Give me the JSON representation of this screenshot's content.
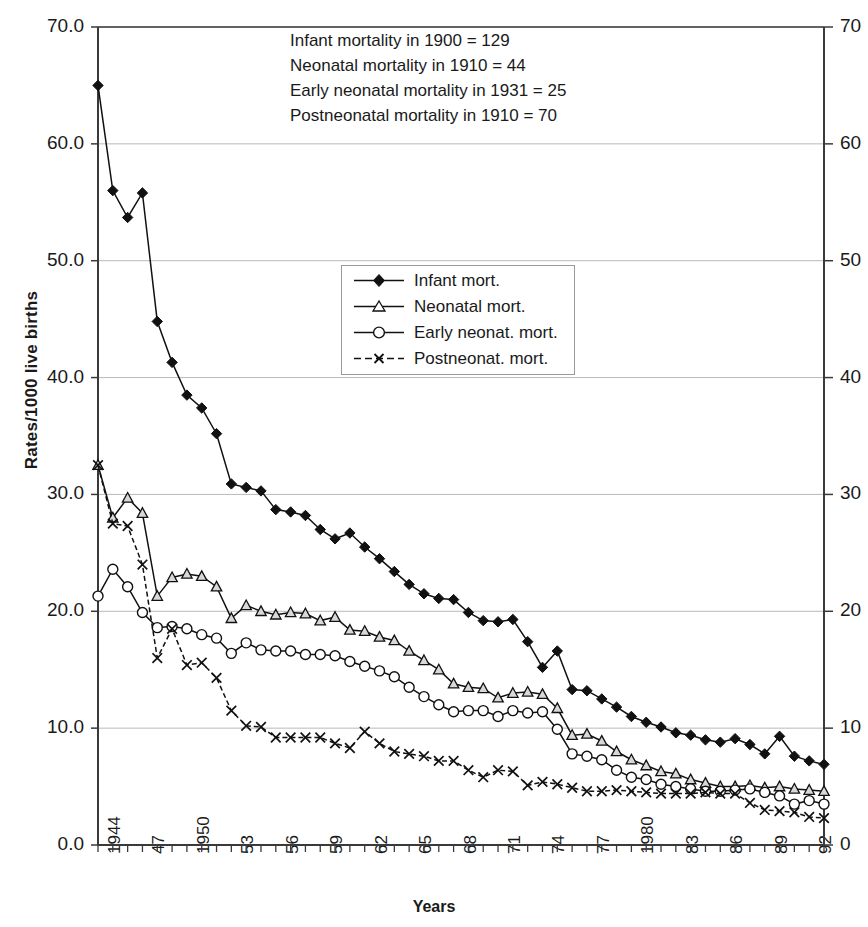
{
  "axes": {
    "ylabel": "Rates/1000 live births",
    "xlabel": "Years",
    "yticks_left": [
      "0.0",
      "10.0",
      "20.0",
      "30.0",
      "40.0",
      "50.0",
      "60.0",
      "70.0"
    ],
    "yticks_right": [
      "0",
      "10",
      "20",
      "30",
      "40",
      "50",
      "60",
      "70"
    ],
    "xticks": [
      "1944",
      "47",
      "1950",
      "53",
      "56",
      "59",
      "62",
      "65",
      "68",
      "71",
      "74",
      "77",
      "1980",
      "83",
      "86",
      "89",
      "92"
    ]
  },
  "annotations": [
    "Infant mortality in 1900 = 129",
    "Neonatal mortality in 1910 = 44",
    "Early neonatal mortality in 1931 = 25",
    "Postneonatal mortality in 1910 = 70"
  ],
  "legend": [
    {
      "label": "Infant mort.",
      "marker": "filled-diamond-marker"
    },
    {
      "label": "Neonatal mort.",
      "marker": "open-triangle-marker"
    },
    {
      "label": "Early neonat. mort.",
      "marker": "open-circle-marker"
    },
    {
      "label": "Postneonat. mort.",
      "marker": "cross-x-marker"
    }
  ],
  "chart_data": {
    "type": "line",
    "title": "",
    "xlabel": "Years",
    "ylabel": "Rates/1000 live births",
    "ylim": [
      0,
      70
    ],
    "xlim": [
      1944,
      1993
    ],
    "grid": true,
    "legend_position": "inside-upper-center",
    "x": [
      1944,
      1945,
      1946,
      1947,
      1948,
      1949,
      1950,
      1951,
      1952,
      1953,
      1954,
      1955,
      1956,
      1957,
      1958,
      1959,
      1960,
      1961,
      1962,
      1963,
      1964,
      1965,
      1966,
      1967,
      1968,
      1969,
      1970,
      1971,
      1972,
      1973,
      1974,
      1975,
      1976,
      1977,
      1978,
      1979,
      1980,
      1981,
      1982,
      1983,
      1984,
      1985,
      1986,
      1987,
      1988,
      1989,
      1990,
      1991,
      1992,
      1993
    ],
    "xtick_labels": [
      "1944",
      "47",
      "1950",
      "53",
      "56",
      "59",
      "62",
      "65",
      "68",
      "71",
      "74",
      "77",
      "1980",
      "83",
      "86",
      "89",
      "92"
    ],
    "series": [
      {
        "name": "Infant mort.",
        "marker": "filled-diamond",
        "values": [
          65.0,
          56.0,
          53.7,
          55.8,
          44.8,
          41.3,
          38.5,
          37.4,
          35.2,
          30.9,
          30.6,
          30.3,
          28.7,
          28.5,
          28.2,
          27.0,
          26.2,
          26.7,
          25.5,
          24.5,
          23.4,
          22.3,
          21.5,
          21.1,
          21.0,
          19.9,
          19.2,
          19.1,
          19.3,
          17.4,
          15.2,
          16.6,
          13.3,
          13.2,
          12.5,
          11.8,
          11.0,
          10.5,
          10.1,
          9.6,
          9.4,
          9.0,
          8.8,
          9.1,
          8.6,
          7.8,
          9.3,
          7.6,
          7.2,
          6.9
        ]
      },
      {
        "name": "Neonatal mort.",
        "marker": "open-triangle",
        "values": [
          32.5,
          28.0,
          29.7,
          28.4,
          21.3,
          22.9,
          23.2,
          23.0,
          22.1,
          19.4,
          20.5,
          20.0,
          19.7,
          19.9,
          19.8,
          19.2,
          19.5,
          18.4,
          18.3,
          17.8,
          17.5,
          16.6,
          15.8,
          15.0,
          13.8,
          13.5,
          13.4,
          12.6,
          13.0,
          13.1,
          12.9,
          11.7,
          9.4,
          9.5,
          8.9,
          8.0,
          7.3,
          6.8,
          6.3,
          6.1,
          5.6,
          5.3,
          5.0,
          5.0,
          5.1,
          4.9,
          5.0,
          4.8,
          4.7,
          4.6
        ]
      },
      {
        "name": "Early neonat. mort.",
        "marker": "open-circle",
        "values": [
          21.3,
          23.6,
          22.1,
          19.9,
          18.6,
          18.7,
          18.5,
          18.0,
          17.7,
          16.4,
          17.3,
          16.7,
          16.6,
          16.6,
          16.3,
          16.3,
          16.2,
          15.7,
          15.3,
          14.9,
          14.4,
          13.5,
          12.7,
          12.0,
          11.4,
          11.5,
          11.5,
          11.0,
          11.5,
          11.3,
          11.4,
          9.9,
          7.8,
          7.6,
          7.3,
          6.4,
          5.8,
          5.6,
          5.2,
          5.0,
          4.8,
          4.6,
          4.6,
          4.7,
          4.8,
          4.5,
          4.2,
          3.5,
          3.8,
          3.5
        ]
      },
      {
        "name": "Postneonat. mort.",
        "marker": "cross-x",
        "values": [
          32.5,
          27.5,
          27.3,
          24.0,
          16.0,
          18.5,
          15.4,
          15.6,
          14.3,
          11.5,
          10.2,
          10.1,
          9.2,
          9.2,
          9.2,
          9.2,
          8.7,
          8.3,
          9.7,
          8.7,
          8.0,
          7.8,
          7.6,
          7.2,
          7.2,
          6.4,
          5.8,
          6.4,
          6.3,
          5.1,
          5.4,
          5.2,
          4.9,
          4.6,
          4.6,
          4.7,
          4.6,
          4.5,
          4.4,
          4.4,
          4.4,
          4.5,
          4.4,
          4.4,
          3.6,
          3.0,
          2.9,
          2.8,
          2.4,
          2.3
        ]
      }
    ]
  }
}
